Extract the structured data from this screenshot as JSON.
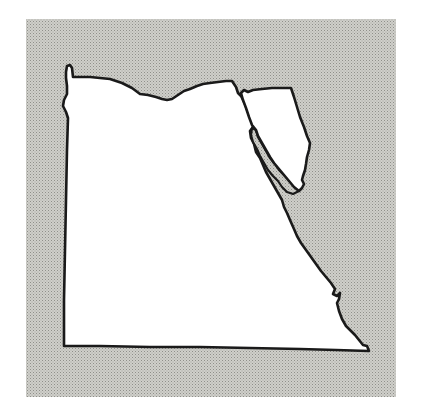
{
  "map": {
    "subject": "Egypt outline map",
    "description": "Blank outline of Egypt including the Sinai Peninsula on a stippled gray background",
    "colors": {
      "background_page": "#ffffff",
      "frame_fill": "#c9c9c4",
      "frame_dots": "#9a9a94",
      "land_fill": "#ffffff",
      "outline": "#1a1a1a",
      "gulf_fill": "#d8d8d2"
    },
    "regions": [
      {
        "name": "Egypt mainland"
      },
      {
        "name": "Sinai Peninsula"
      },
      {
        "name": "Gulf of Suez"
      }
    ]
  }
}
